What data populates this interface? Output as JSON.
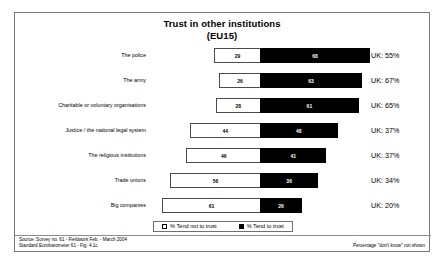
{
  "chart_data": {
    "type": "bar",
    "subtype": "diverging-stacked-bar",
    "title": "Trust in other institutions",
    "subtitle": "(EU15)",
    "xlabel": "",
    "ylabel": "",
    "grid": false,
    "legend_position": "bottom-center",
    "categories": [
      "The police",
      "The army",
      "Charitable or voluntary organisations",
      "Justice / the national legal system",
      "The religious institutions",
      "Trade unions",
      "Big companies"
    ],
    "series": [
      {
        "name": "% Tend not to trust",
        "color": "#ffffff",
        "direction": "left",
        "values": [
          29,
          26,
          28,
          44,
          46,
          56,
          61
        ]
      },
      {
        "name": "% Tend to trust",
        "color": "#000000",
        "direction": "right",
        "values": [
          68,
          63,
          61,
          48,
          41,
          36,
          26
        ]
      }
    ],
    "annotations": [
      "UK: 55%",
      "UK: 67%",
      "UK: 65%",
      "UK: 37%",
      "UK: 37%",
      "UK: 34%",
      "UK: 20%"
    ],
    "note": "Percentage \"don't know\" not shown"
  },
  "legend": {
    "items": [
      {
        "label": "% Tend not to trust",
        "swatch": "white"
      },
      {
        "label": "% Tend to trust",
        "swatch": "black"
      }
    ]
  },
  "source": {
    "line1": "Source: Survey no. 61 - Fieldwork Feb. - March 2004",
    "line2": "Standard Eurobarometer 61 - Fig. 4.1c"
  }
}
